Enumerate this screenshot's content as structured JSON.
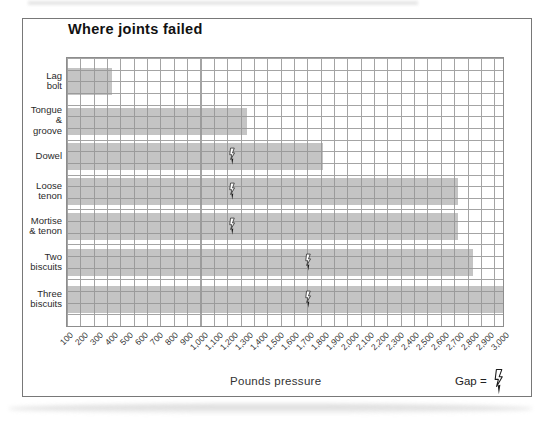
{
  "figure": {
    "title": "Where joints failed",
    "x_axis_label": "Pounds pressure",
    "legend_text": "Gap =",
    "legend_icon": "lightning-gap-icon"
  },
  "chart_data": {
    "type": "bar",
    "orientation": "horizontal",
    "title": "Where joints failed",
    "xlabel": "Pounds pressure",
    "grid": true,
    "x_axis": {
      "min": 100,
      "max": 3000,
      "tick_step": 100,
      "units": "pounds pressure"
    },
    "categories": [
      "Lag bolt",
      "Tongue & groove",
      "Dowel",
      "Loose tenon",
      "Mortise & tenon",
      "Two biscuits",
      "Three biscuits"
    ],
    "series": [
      {
        "name": "Pressure at failure (lbs)",
        "values": [
          400,
          1300,
          1800,
          2700,
          2700,
          2800,
          3000
        ]
      }
    ],
    "gap_markers": {
      "legend": "Gap = lightning-bolt symbol drawn on bar",
      "values": [
        null,
        null,
        1200,
        1200,
        1200,
        1700,
        1700
      ]
    }
  },
  "rows": [
    {
      "label": "Lag\nbolt",
      "value": 400,
      "gap": null
    },
    {
      "label": "Tongue\n&\ngroove",
      "value": 1300,
      "gap": null
    },
    {
      "label": "Dowel",
      "value": 1800,
      "gap": 1200
    },
    {
      "label": "Loose\ntenon",
      "value": 2700,
      "gap": 1200
    },
    {
      "label": "Mortise\n& tenon",
      "value": 2700,
      "gap": 1200
    },
    {
      "label": "Two\nbiscuits",
      "value": 2800,
      "gap": 1700
    },
    {
      "label": "Three\nbiscuits",
      "value": 3000,
      "gap": 1700
    }
  ],
  "x_tick_labels": [
    "100",
    "200",
    "300",
    "400",
    "500",
    "600",
    "700",
    "800",
    "900",
    "1,000",
    "1,100",
    "1,200",
    "1,300",
    "1,400",
    "1,500",
    "1,600",
    "1,700",
    "1,800",
    "1,900",
    "2,000",
    "2,100",
    "2,200",
    "2,300",
    "2,400",
    "2,500",
    "2,600",
    "2,700",
    "2,800",
    "2,900",
    "3,000"
  ],
  "colors": {
    "bar_fill": "#c5c5c5",
    "grid_line": "#a4a4a4",
    "frame_border": "#787878",
    "text": "#1c1c1c",
    "background": "#ffffff"
  }
}
